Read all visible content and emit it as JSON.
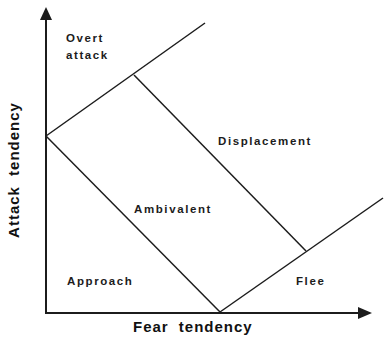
{
  "diagram": {
    "type": "region-diagram",
    "x_axis": {
      "label": "Fear tendency"
    },
    "y_axis": {
      "label": "Attack tendency"
    },
    "regions": [
      {
        "id": "overt",
        "lines": [
          "Overt",
          "attack"
        ]
      },
      {
        "id": "displacement",
        "label": "Displacement"
      },
      {
        "id": "ambivalent",
        "label": "Ambivalent"
      },
      {
        "id": "approach",
        "label": "Approach"
      },
      {
        "id": "flee",
        "label": "Flee"
      }
    ],
    "boundaries": [
      {
        "name": "upper-diagonal",
        "from": [
          46,
          136
        ],
        "to": [
          205,
          23
        ]
      },
      {
        "name": "lower-diagonal",
        "from": [
          220,
          312
        ],
        "to": [
          383,
          198
        ]
      },
      {
        "name": "left-cross",
        "from": [
          46,
          136
        ],
        "to": [
          220,
          312
        ]
      },
      {
        "name": "right-cross",
        "from": [
          134,
          75
        ],
        "to": [
          306,
          251
        ]
      }
    ],
    "axes_geometry": {
      "origin": [
        46,
        313
      ],
      "y_arrow_tip": [
        46,
        8
      ],
      "x_arrow_tip": [
        371,
        313
      ]
    },
    "colors": {
      "ink": "#1c1c1c",
      "background": "#ffffff"
    }
  }
}
